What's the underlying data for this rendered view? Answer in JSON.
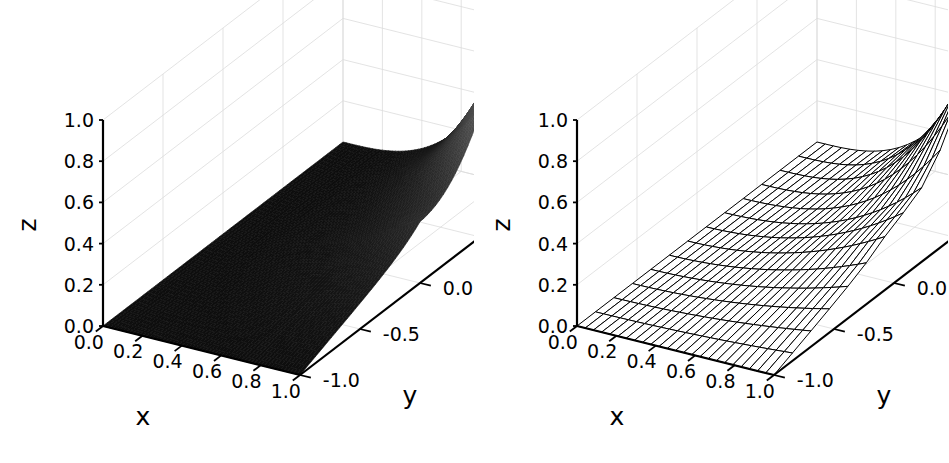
{
  "figure": {
    "background_color": "#ffffff",
    "width": 949,
    "height": 463,
    "panel_count": 2
  },
  "chart_data": [
    {
      "type": "surface",
      "title": "",
      "subtitle": "",
      "panel_index": 0,
      "render_style": "shaded-surface",
      "surface_colormap": "grayscale",
      "surface_dark_color": "#111111",
      "surface_light_color": "#8a8a8a",
      "xlabel": "x",
      "ylabel": "y",
      "zlabel": "z",
      "xlim": [
        0.0,
        1.0
      ],
      "ylim": [
        -1.0,
        1.0
      ],
      "zlim": [
        0.0,
        1.0
      ],
      "xticks": [
        "0.0",
        "0.2",
        "0.4",
        "0.6",
        "0.8",
        "1.0"
      ],
      "xtick_values": [
        0.0,
        0.2,
        0.4,
        0.6,
        0.8,
        1.0
      ],
      "yticks": [
        "-1.0",
        "-0.5",
        "0.0",
        "0.5",
        "1.0"
      ],
      "ytick_values": [
        -1.0,
        -0.5,
        0.0,
        0.5,
        1.0
      ],
      "zticks": [
        "0.0",
        "0.2",
        "0.4",
        "0.6",
        "0.8",
        "1.0"
      ],
      "ztick_values": [
        0.0,
        0.2,
        0.4,
        0.6,
        0.8,
        1.0
      ],
      "grid": true,
      "legend": null,
      "legend_position": "none",
      "elev": 22,
      "azim": -60,
      "z_formula": "x^3 * exp(-3*(y-1)^2) + 0.45*x^2*(1-|y|)*0.55",
      "z_at_corners": {
        "x0_ym1": 0.0,
        "x0_yp1": 0.0,
        "x1_ym1": 0.0,
        "x1_yp1": 1.0
      },
      "peak": {
        "x": 1.0,
        "y": 1.0,
        "z": 1.0
      }
    },
    {
      "type": "surface",
      "title": "",
      "subtitle": "",
      "panel_index": 1,
      "render_style": "wireframe",
      "wire_color": "#000000",
      "face_color": "#ffffff",
      "xlabel": "x",
      "ylabel": "y",
      "zlabel": "z",
      "xlim": [
        0.0,
        1.0
      ],
      "ylim": [
        -1.0,
        1.0
      ],
      "zlim": [
        0.0,
        1.0
      ],
      "xticks": [
        "0.0",
        "0.2",
        "0.4",
        "0.6",
        "0.8",
        "1.0"
      ],
      "xtick_values": [
        0.0,
        0.2,
        0.4,
        0.6,
        0.8,
        1.0
      ],
      "yticks": [
        "-1.0",
        "-0.5",
        "0.0",
        "0.5",
        "1.0"
      ],
      "ytick_values": [
        -1.0,
        -0.5,
        0.0,
        0.5,
        1.0
      ],
      "zticks": [
        "0.0",
        "0.2",
        "0.4",
        "0.6",
        "0.8",
        "1.0"
      ],
      "ztick_values": [
        0.0,
        0.2,
        0.4,
        0.6,
        0.8,
        1.0
      ],
      "grid": true,
      "legend": null,
      "legend_position": "none",
      "elev": 22,
      "azim": -60,
      "z_formula": "x^3 * exp(-3*(y-1)^2) + 0.45*x^2*(1-|y|)*0.55",
      "z_at_corners": {
        "x0_ym1": 0.0,
        "x0_yp1": 0.0,
        "x1_ym1": 0.0,
        "x1_yp1": 1.0
      },
      "peak": {
        "x": 1.0,
        "y": 1.0,
        "z": 1.0
      },
      "mesh_rows": 24,
      "mesh_cols": 13
    }
  ]
}
